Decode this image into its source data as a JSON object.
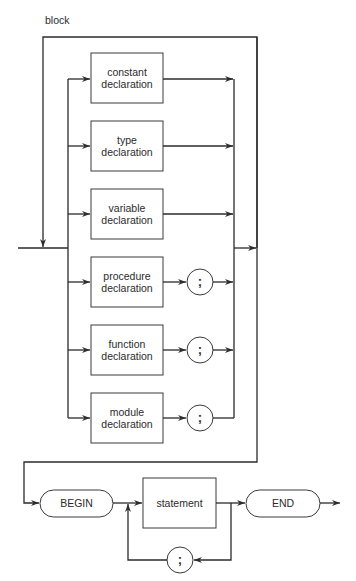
{
  "diagram": {
    "title": "block",
    "declarations": [
      {
        "line1": "constant",
        "line2": "declaration",
        "has_semicolon": false
      },
      {
        "line1": "type",
        "line2": "declaration",
        "has_semicolon": false
      },
      {
        "line1": "variable",
        "line2": "declaration",
        "has_semicolon": false
      },
      {
        "line1": "procedure",
        "line2": "declaration",
        "has_semicolon": true
      },
      {
        "line1": "function",
        "line2": "declaration",
        "has_semicolon": true
      },
      {
        "line1": "module",
        "line2": "declaration",
        "has_semicolon": true
      }
    ],
    "semicolon": ";",
    "begin_label": "BEGIN",
    "statement_label": "statement",
    "end_label": "END",
    "loop_separator": ";",
    "colors": {
      "line": "#2b2b2b",
      "box_border": "#3a3a3a",
      "background": "#ffffff"
    }
  }
}
